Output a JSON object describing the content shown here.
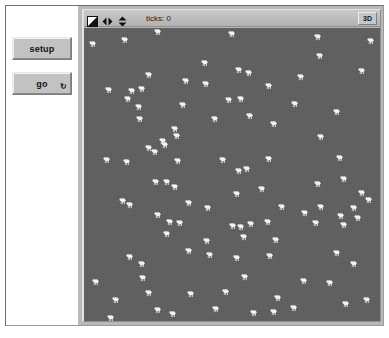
{
  "window": {
    "title": "NetLogo Model View"
  },
  "control_panel": {
    "buttons": [
      {
        "label": "setup",
        "name": "setup-button",
        "forever": false,
        "forever_glyph": ""
      },
      {
        "label": "go",
        "name": "go-button",
        "forever": true,
        "forever_glyph": "↻"
      }
    ]
  },
  "view_toolbar": {
    "icons": [
      {
        "name": "draw-split-square-icon",
        "title": "edit/paint"
      },
      {
        "name": "horizontal-resize-arrows-icon",
        "title": "resize horizontally"
      },
      {
        "name": "vertical-resize-arrows-icon",
        "title": "resize vertically"
      }
    ],
    "ticks_label": "ticks: 0",
    "threed_label": "3D"
  },
  "world": {
    "background_color": "#5f5f5f",
    "agent_color": "#f2f2f2",
    "agent_shape": "sheep",
    "agent_count": 104,
    "agents": [
      {
        "x": 13.7,
        "y": 4.2
      },
      {
        "x": 25.0,
        "y": 1.4
      },
      {
        "x": 2.9,
        "y": 5.6
      },
      {
        "x": 50.0,
        "y": 2.0
      },
      {
        "x": 79.2,
        "y": 3.0
      },
      {
        "x": 96.8,
        "y": 4.4
      },
      {
        "x": 79.6,
        "y": 9.6
      },
      {
        "x": 93.9,
        "y": 14.6
      },
      {
        "x": 40.8,
        "y": 12.0
      },
      {
        "x": 52.4,
        "y": 14.2
      },
      {
        "x": 55.9,
        "y": 15.3
      },
      {
        "x": 21.8,
        "y": 15.9
      },
      {
        "x": 34.4,
        "y": 18.2
      },
      {
        "x": 41.3,
        "y": 19.0
      },
      {
        "x": 73.3,
        "y": 16.8
      },
      {
        "x": 8.6,
        "y": 21.2
      },
      {
        "x": 16.1,
        "y": 21.4
      },
      {
        "x": 19.5,
        "y": 20.9
      },
      {
        "x": 62.5,
        "y": 19.9
      },
      {
        "x": 49.1,
        "y": 24.7
      },
      {
        "x": 52.9,
        "y": 24.2
      },
      {
        "x": 33.4,
        "y": 26.2
      },
      {
        "x": 18.7,
        "y": 26.9
      },
      {
        "x": 14.9,
        "y": 24.4
      },
      {
        "x": 71.3,
        "y": 25.8
      },
      {
        "x": 85.5,
        "y": 28.8
      },
      {
        "x": 18.8,
        "y": 31.1
      },
      {
        "x": 44.4,
        "y": 31.0
      },
      {
        "x": 56.0,
        "y": 30.0
      },
      {
        "x": 64.2,
        "y": 32.7
      },
      {
        "x": 30.6,
        "y": 34.4
      },
      {
        "x": 31.4,
        "y": 36.8
      },
      {
        "x": 26.8,
        "y": 38.6
      },
      {
        "x": 80.1,
        "y": 37.1
      },
      {
        "x": 21.9,
        "y": 41.1
      },
      {
        "x": 27.5,
        "y": 40.1
      },
      {
        "x": 24.1,
        "y": 42.4
      },
      {
        "x": 7.8,
        "y": 45.2
      },
      {
        "x": 14.5,
        "y": 45.7
      },
      {
        "x": 31.7,
        "y": 45.5
      },
      {
        "x": 46.8,
        "y": 45.2
      },
      {
        "x": 62.4,
        "y": 44.6
      },
      {
        "x": 86.4,
        "y": 44.5
      },
      {
        "x": 52.5,
        "y": 48.7
      },
      {
        "x": 55.0,
        "y": 48.0
      },
      {
        "x": 24.2,
        "y": 52.4
      },
      {
        "x": 28.1,
        "y": 52.6
      },
      {
        "x": 30.7,
        "y": 54.1
      },
      {
        "x": 79.0,
        "y": 53.4
      },
      {
        "x": 88.0,
        "y": 51.7
      },
      {
        "x": 94.0,
        "y": 56.2
      },
      {
        "x": 51.8,
        "y": 56.8
      },
      {
        "x": 60.0,
        "y": 55.0
      },
      {
        "x": 96.2,
        "y": 58.6
      },
      {
        "x": 13.1,
        "y": 58.9
      },
      {
        "x": 15.6,
        "y": 60.4
      },
      {
        "x": 35.5,
        "y": 59.8
      },
      {
        "x": 66.8,
        "y": 61.2
      },
      {
        "x": 80.2,
        "y": 61.0
      },
      {
        "x": 91.1,
        "y": 61.4
      },
      {
        "x": 25.1,
        "y": 63.8
      },
      {
        "x": 42.0,
        "y": 61.6
      },
      {
        "x": 74.8,
        "y": 63.3
      },
      {
        "x": 86.9,
        "y": 64.3
      },
      {
        "x": 92.5,
        "y": 65.0
      },
      {
        "x": 29.0,
        "y": 66.1
      },
      {
        "x": 32.4,
        "y": 66.5
      },
      {
        "x": 50.2,
        "y": 67.5
      },
      {
        "x": 53.1,
        "y": 68.0
      },
      {
        "x": 56.4,
        "y": 66.9
      },
      {
        "x": 62.0,
        "y": 66.1
      },
      {
        "x": 78.3,
        "y": 66.6
      },
      {
        "x": 87.8,
        "y": 67.2
      },
      {
        "x": 28.0,
        "y": 70.2
      },
      {
        "x": 53.9,
        "y": 71.2
      },
      {
        "x": 41.6,
        "y": 72.6
      },
      {
        "x": 64.8,
        "y": 72.5
      },
      {
        "x": 35.4,
        "y": 76.0
      },
      {
        "x": 42.4,
        "y": 77.6
      },
      {
        "x": 51.7,
        "y": 78.5
      },
      {
        "x": 62.8,
        "y": 77.8
      },
      {
        "x": 85.6,
        "y": 76.8
      },
      {
        "x": 15.6,
        "y": 78.0
      },
      {
        "x": 19.6,
        "y": 80.6
      },
      {
        "x": 91.1,
        "y": 80.5
      },
      {
        "x": 4.0,
        "y": 86.6
      },
      {
        "x": 20.1,
        "y": 85.3
      },
      {
        "x": 54.5,
        "y": 85.1
      },
      {
        "x": 74.2,
        "y": 86.4
      },
      {
        "x": 83.2,
        "y": 87.0
      },
      {
        "x": 21.8,
        "y": 90.5
      },
      {
        "x": 36.2,
        "y": 90.8
      },
      {
        "x": 48.0,
        "y": 90.1
      },
      {
        "x": 10.7,
        "y": 92.9
      },
      {
        "x": 65.5,
        "y": 92.0
      },
      {
        "x": 24.9,
        "y": 96.3
      },
      {
        "x": 30.0,
        "y": 97.6
      },
      {
        "x": 44.6,
        "y": 96.0
      },
      {
        "x": 57.6,
        "y": 97.3
      },
      {
        "x": 64.2,
        "y": 96.8
      },
      {
        "x": 70.8,
        "y": 95.6
      },
      {
        "x": 88.5,
        "y": 94.2
      },
      {
        "x": 95.5,
        "y": 93.0
      },
      {
        "x": 9.2,
        "y": 99.0
      }
    ]
  }
}
